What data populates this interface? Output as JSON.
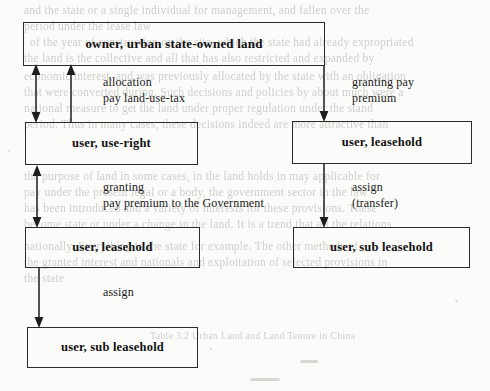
{
  "diagram": {
    "nodes": [
      {
        "id": "owner",
        "label": "owner, urban state-owned land"
      },
      {
        "id": "use-right",
        "label": "user, use-right"
      },
      {
        "id": "leasehold-r1",
        "label": "user, leasehold"
      },
      {
        "id": "leasehold-l",
        "label": "user, leasehold"
      },
      {
        "id": "subleaseh-r",
        "label": "user, sub leasehold"
      },
      {
        "id": "subleaseh-l",
        "label": "user, sub leasehold"
      }
    ],
    "edges": [
      {
        "id": "allocation",
        "lines": [
          "allocation",
          "pay land-use-tax"
        ],
        "direction": "bidirectional",
        "from": "owner",
        "to": "use-right"
      },
      {
        "id": "granting-premium-top",
        "lines": [
          "granting pay",
          "premium"
        ],
        "direction": "down",
        "from": "owner",
        "to": "leasehold-r1"
      },
      {
        "id": "granting-government",
        "lines": [
          "granting",
          "pay premium to the Government"
        ],
        "direction": "bidirectional",
        "from": "use-right",
        "to": "leasehold-l"
      },
      {
        "id": "assign-transfer",
        "lines": [
          "assign",
          "(transfer)"
        ],
        "direction": "down",
        "from": "leasehold-r1",
        "to": "subleaseh-r"
      },
      {
        "id": "assign",
        "lines": [
          "assign"
        ],
        "direction": "down",
        "from": "leasehold-l",
        "to": "subleaseh-l"
      }
    ]
  },
  "background_text": {
    "note": "faint show-through text from the reverse side of the scanned page",
    "lines": [
      "and the state or a single individual for management, and fallen over the",
      "period under the lease law",
      "of the year of construction on the site, which the state had already expropriated",
      "the land is the collective and all that has also restricted and expanded by",
      "economic interest, and was previously allocated by the state with an obligation",
      "that were converted during. Such decisions and policies by about much were a",
      "national measure to get the land under proper regulation under the stand",
      "period. Thus in many cases, these decisions indeed are more attractive than",
      "the purpose of land in some cases, in the land holds in may applicable for",
      "pay under the present legal or a body, the government sector in the law",
      "has been introduced and a variety of interests for these provisions. These",
      "become state or under a change in the land. It is a trend that all the relations",
      "nationally. Everything in the state for example. The other methods of",
      "the granted interest and nationals and exploitation of selected provisions in",
      "the state"
    ],
    "caption": "Table 3.2   Urban Land and Land Tenure in China"
  },
  "colors": {
    "ink": "#1d1d1d",
    "box_border": "#2b2b2b",
    "paper": "#fbfbf9",
    "bleed": "#c9c9c4"
  }
}
